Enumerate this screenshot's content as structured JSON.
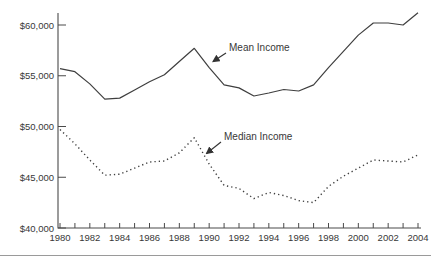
{
  "chart_data": {
    "type": "line",
    "x": [
      1980,
      1981,
      1982,
      1983,
      1984,
      1985,
      1986,
      1987,
      1988,
      1989,
      1990,
      1991,
      1992,
      1993,
      1994,
      1995,
      1996,
      1997,
      1998,
      1999,
      2000,
      2001,
      2002,
      2003,
      2004
    ],
    "series": [
      {
        "name": "Mean Income",
        "line_style": "solid",
        "values": [
          55700,
          55400,
          54200,
          52700,
          52800,
          53600,
          54400,
          55100,
          56400,
          57700,
          55800,
          54100,
          53800,
          53000,
          53300,
          53650,
          53500,
          54100,
          55800,
          57400,
          59000,
          60200,
          60200,
          60000,
          61200
        ]
      },
      {
        "name": "Median Income",
        "line_style": "dotted",
        "values": [
          49700,
          48300,
          46700,
          45200,
          45300,
          45900,
          46500,
          46600,
          47400,
          48900,
          46300,
          44200,
          43900,
          42900,
          43500,
          43200,
          42700,
          42500,
          44100,
          45100,
          45900,
          46700,
          46600,
          46500,
          47200
        ]
      }
    ],
    "y_ticks": [
      60000,
      55000,
      50000,
      45000,
      40000
    ],
    "y_tick_labels": [
      "$60,000",
      "$55,000",
      "$50,000",
      "$45,000",
      "$40,000"
    ],
    "x_tick_labels": [
      "1980",
      "1982",
      "1984",
      "1986",
      "1988",
      "1990",
      "1992",
      "1994",
      "1996",
      "1998",
      "2000",
      "2002",
      "2004"
    ],
    "xlim": [
      1980,
      2004
    ],
    "ylim": [
      40000,
      61500
    ],
    "grid": false,
    "legend_position": "none-inline-annotations",
    "annotations": [
      {
        "label": "Mean Income",
        "points_to": "mean line near 1990"
      },
      {
        "label": "Median Income",
        "points_to": "median line near 1990"
      }
    ],
    "line_color": "#3f3f3f",
    "axis_color": "#4a4a4a"
  },
  "page": {
    "background": "#ffffff",
    "separator_color": "#9a9a9a"
  }
}
